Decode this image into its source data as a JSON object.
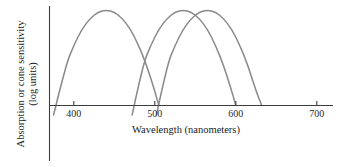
{
  "chart_data": {
    "type": "line",
    "title": "",
    "xlabel": "Wavelength (nanometers)",
    "ylabel_line1": "Absorption or cone sensitivity",
    "ylabel_line2": "(log units)",
    "xlim": [
      370,
      720
    ],
    "ylim": [
      0,
      1
    ],
    "grid": false,
    "legend": "none",
    "xticks": [
      400,
      500,
      600,
      700
    ],
    "xtick_labels": [
      "400",
      "500",
      "600",
      "700"
    ],
    "yticks": [],
    "ytick_labels": [],
    "series": [
      {
        "name": "S cone",
        "peak_x": 440,
        "peak_y": 1.0,
        "half_width": 62,
        "x_start": 375,
        "x_end": 505,
        "color": "#8a8a8a",
        "x": [
          375,
          390,
          400,
          410,
          420,
          430,
          440,
          450,
          460,
          470,
          480,
          490,
          500,
          505
        ],
        "y": [
          -0.1,
          0.42,
          0.63,
          0.8,
          0.91,
          0.98,
          1.0,
          0.98,
          0.91,
          0.8,
          0.63,
          0.42,
          0.15,
          0.0
        ]
      },
      {
        "name": "M cone",
        "peak_x": 535,
        "peak_y": 1.0,
        "half_width": 62,
        "x_start": 472,
        "x_end": 600,
        "color": "#8a8a8a",
        "x": [
          472,
          485,
          495,
          505,
          515,
          525,
          535,
          545,
          555,
          565,
          575,
          585,
          595,
          600
        ],
        "y": [
          -0.1,
          0.42,
          0.63,
          0.8,
          0.91,
          0.98,
          1.0,
          0.98,
          0.91,
          0.8,
          0.63,
          0.42,
          0.15,
          0.0
        ]
      },
      {
        "name": "L cone",
        "peak_x": 565,
        "peak_y": 1.0,
        "half_width": 62,
        "x_start": 502,
        "x_end": 632,
        "color": "#8a8a8a",
        "x": [
          502,
          515,
          525,
          535,
          545,
          555,
          565,
          575,
          585,
          595,
          605,
          615,
          625,
          632
        ],
        "y": [
          -0.1,
          0.42,
          0.63,
          0.8,
          0.91,
          0.98,
          1.0,
          0.98,
          0.91,
          0.8,
          0.63,
          0.42,
          0.15,
          0.0
        ]
      }
    ]
  },
  "colors": {
    "curve": "#8a8a8a",
    "axis": "#3c3c3c",
    "text": "#1a1a1a",
    "background": "#ffffff"
  }
}
